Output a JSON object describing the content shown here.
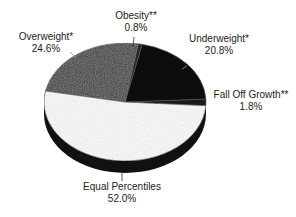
{
  "chart_data": {
    "type": "pie",
    "title": "",
    "style": "3d",
    "start_angle_deg": -3.6,
    "direction": "counterclockwise",
    "slices": [
      {
        "label": "Fall Off Growth**",
        "value": 1.8,
        "display": "1.8%",
        "color": "#1a1a1a"
      },
      {
        "label": "Underweight*",
        "value": 20.8,
        "display": "20.8%",
        "color": "#0d0d0d"
      },
      {
        "label": "Obesity**",
        "value": 0.8,
        "display": "0.8%",
        "color": "#2a2a2a"
      },
      {
        "label": "Overweight*",
        "value": 24.6,
        "display": "24.6%",
        "color": "#3a3a3a"
      },
      {
        "label": "Equal Percentiles",
        "value": 52.0,
        "display": "52.0%",
        "color": "#fbfbfb"
      }
    ],
    "legend": "none (direct labels)"
  },
  "labels": {
    "overweight": {
      "name": "Overweight*",
      "pct": "24.6%"
    },
    "obesity": {
      "name": "Obesity**",
      "pct": "0.8%"
    },
    "underweight": {
      "name": "Underweight*",
      "pct": "20.8%"
    },
    "fall_off": {
      "name": "Fall Off Growth**",
      "pct": "1.8%"
    },
    "equal": {
      "name": "Equal Percentiles",
      "pct": "52.0%"
    }
  }
}
